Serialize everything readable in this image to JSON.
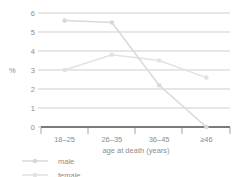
{
  "chart_data": {
    "type": "line",
    "title": "",
    "xlabel": "age at death (years)",
    "ylabel": "%",
    "categories": [
      "18–25",
      "26–35",
      "36–45",
      "≥46"
    ],
    "series": [
      {
        "name": "male",
        "values": [
          5.6,
          5.5,
          2.2,
          0.0
        ],
        "color": "#d9d9d9"
      },
      {
        "name": "female",
        "values": [
          3.0,
          3.8,
          3.5,
          2.6
        ],
        "color": "#e2e2e2"
      }
    ],
    "ylim": [
      0,
      6
    ],
    "yticks": [
      "0",
      "1",
      "2",
      "3",
      "4",
      "5",
      "6"
    ],
    "grid": true,
    "legend_position": "bottom-left"
  },
  "legend": {
    "items": [
      {
        "label": "male",
        "marker": "circle-marker",
        "color": "#d9d9d9"
      },
      {
        "label": "female",
        "marker": "circle-marker",
        "color": "#e2e2e2"
      }
    ]
  },
  "colors": {
    "grid": "#b9b9b9",
    "axis": "#6f6f6f",
    "text": "#8d8d8d",
    "background": "#ffffff"
  }
}
